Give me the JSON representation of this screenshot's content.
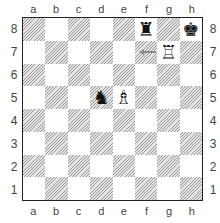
{
  "diagram": {
    "files": [
      "a",
      "b",
      "c",
      "d",
      "e",
      "f",
      "g",
      "h"
    ],
    "ranks": [
      "8",
      "7",
      "6",
      "5",
      "4",
      "3",
      "2",
      "1"
    ],
    "colors": {
      "dark_square": "#9a9a9a",
      "light_square": "#ffffff",
      "border": "#222222",
      "arrow": "#8a8a8a"
    },
    "pieces": [
      {
        "square": "f8",
        "color": "black",
        "type": "rook",
        "glyph": "♜"
      },
      {
        "square": "h8",
        "color": "black",
        "type": "king",
        "glyph": "♚"
      },
      {
        "square": "g7",
        "color": "white",
        "type": "rook",
        "glyph": "♖"
      },
      {
        "square": "d5",
        "color": "black",
        "type": "knight",
        "glyph": "♞"
      },
      {
        "square": "e5",
        "color": "white",
        "type": "bishop",
        "glyph": "♗"
      }
    ],
    "arrows": [
      {
        "from": "g7",
        "to": "f7",
        "direction": "left"
      }
    ]
  }
}
